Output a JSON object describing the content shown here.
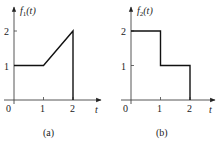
{
  "chart_data": [
    {
      "type": "line",
      "id": "a",
      "caption": "(a)",
      "ylabel": "f1(t)",
      "ylabel_main": "f",
      "ylabel_sub": "1",
      "ylabel_arg": "(t)",
      "xlabel": "t",
      "xlim": [
        0,
        2.6
      ],
      "ylim": [
        0,
        2.6
      ],
      "x_ticks": [
        "0",
        "1",
        "2"
      ],
      "y_ticks": [
        "1",
        "2"
      ],
      "grid": false,
      "points": [
        [
          0,
          1
        ],
        [
          1,
          1
        ],
        [
          2,
          2
        ],
        [
          2,
          0
        ]
      ]
    },
    {
      "type": "line",
      "id": "b",
      "caption": "(b)",
      "ylabel": "f2(t)",
      "ylabel_main": "f",
      "ylabel_sub": "2",
      "ylabel_arg": "(t)",
      "xlabel": "t",
      "xlim": [
        0,
        2.6
      ],
      "ylim": [
        0,
        2.6
      ],
      "x_ticks": [
        "0",
        "1",
        "2"
      ],
      "y_ticks": [
        "1",
        "2"
      ],
      "grid": false,
      "points": [
        [
          0,
          2
        ],
        [
          1,
          2
        ],
        [
          1,
          1
        ],
        [
          2,
          1
        ],
        [
          2,
          0
        ]
      ]
    }
  ]
}
